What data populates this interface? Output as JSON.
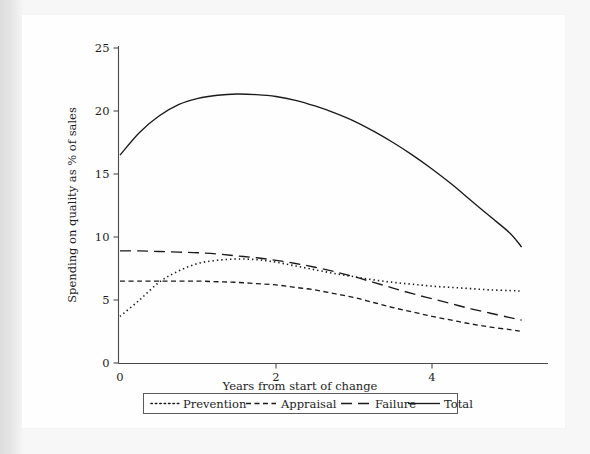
{
  "figure": {
    "background_color": "#e9e9e9",
    "page_color": "#fefefe",
    "ink_color": "#1a1a1a"
  },
  "chart_data": {
    "type": "line",
    "title": "",
    "xlabel": "Years from start of change",
    "ylabel": "Spending on quality as % of sales",
    "xlim": [
      -0.18,
      5.3
    ],
    "ylim": [
      0,
      25
    ],
    "xticks": [
      0,
      2,
      4
    ],
    "xtick_labels": [
      "0",
      "2",
      "4"
    ],
    "yticks": [
      0,
      5,
      10,
      15,
      20,
      25
    ],
    "ytick_labels": [
      "0",
      "5",
      "10",
      "15",
      "20",
      "25"
    ],
    "grid": false,
    "legend_position": "below-axis",
    "x": [
      0,
      0.25,
      0.5,
      0.75,
      1.0,
      1.25,
      1.5,
      1.75,
      2.0,
      2.25,
      2.5,
      2.75,
      3.0,
      3.25,
      3.5,
      3.75,
      4.0,
      4.25,
      4.5,
      4.75,
      5.0,
      5.15
    ],
    "series": [
      {
        "name": "Prevention",
        "dash_style": "dotted",
        "values": [
          3.7,
          5.0,
          6.4,
          7.3,
          7.9,
          8.15,
          8.25,
          8.2,
          8.0,
          7.7,
          7.4,
          7.1,
          6.85,
          6.6,
          6.4,
          6.25,
          6.1,
          6.0,
          5.9,
          5.8,
          5.75,
          5.7
        ]
      },
      {
        "name": "Appraisal",
        "dash_style": "short-dash",
        "values": [
          6.5,
          6.5,
          6.5,
          6.5,
          6.5,
          6.45,
          6.4,
          6.3,
          6.2,
          6.0,
          5.8,
          5.5,
          5.2,
          4.8,
          4.4,
          4.05,
          3.7,
          3.4,
          3.1,
          2.85,
          2.65,
          2.5
        ]
      },
      {
        "name": "Failure",
        "dash_style": "long-dash",
        "values": [
          8.9,
          8.9,
          8.85,
          8.8,
          8.75,
          8.65,
          8.5,
          8.35,
          8.15,
          7.9,
          7.6,
          7.25,
          6.85,
          6.4,
          5.95,
          5.5,
          5.1,
          4.7,
          4.3,
          3.95,
          3.6,
          3.4
        ]
      },
      {
        "name": "Total",
        "dash_style": "solid",
        "values": [
          16.5,
          18.3,
          19.6,
          20.5,
          21.0,
          21.25,
          21.35,
          21.3,
          21.15,
          20.85,
          20.4,
          19.85,
          19.2,
          18.4,
          17.5,
          16.5,
          15.4,
          14.2,
          12.9,
          11.6,
          10.3,
          9.2
        ]
      }
    ],
    "legend": [
      {
        "label": "Prevention",
        "dash_style": "dotted"
      },
      {
        "label": "Appraisal",
        "dash_style": "short-dash"
      },
      {
        "label": "Failure",
        "dash_style": "long-dash"
      },
      {
        "label": "Total",
        "dash_style": "solid"
      }
    ]
  }
}
